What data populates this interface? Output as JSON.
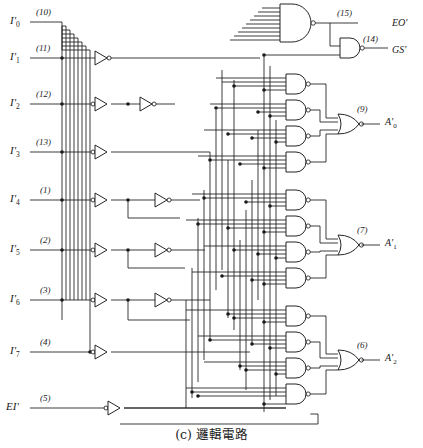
{
  "figure": {
    "caption": "(c) 邏輯電路",
    "ink_color": "#1a1a1a",
    "background": "#ffffff"
  },
  "inputs": [
    {
      "name": "I0",
      "label_html": "I'<sub>0</sub>",
      "pin": "(10)",
      "y": 22
    },
    {
      "name": "I1",
      "label_html": "I'<sub>1</sub>",
      "pin": "(11)",
      "y": 58
    },
    {
      "name": "I2",
      "label_html": "I'<sub>2</sub>",
      "pin": "(12)",
      "y": 104
    },
    {
      "name": "I3",
      "label_html": "I'<sub>3</sub>",
      "pin": "(13)",
      "y": 152
    },
    {
      "name": "I4",
      "label_html": "I'<sub>4</sub>",
      "pin": "(1)",
      "y": 200
    },
    {
      "name": "I5",
      "label_html": "I'<sub>5</sub>",
      "pin": "(2)",
      "y": 250
    },
    {
      "name": "I6",
      "label_html": "I'<sub>6</sub>",
      "pin": "(3)",
      "y": 300
    },
    {
      "name": "I7",
      "label_html": "I'<sub>7</sub>",
      "pin": "(4)",
      "y": 352
    },
    {
      "name": "EI",
      "label_html": "EI'",
      "pin": "(5)",
      "y": 408
    }
  ],
  "outputs": [
    {
      "name": "EO",
      "label_html": "EO'",
      "pin": "(15)",
      "y": 28
    },
    {
      "name": "GS",
      "label_html": "GS'",
      "pin": "(14)",
      "y": 54
    },
    {
      "name": "A0",
      "label_html": "A'<sub>0</sub>",
      "pin": "(9)",
      "y": 124
    },
    {
      "name": "A1",
      "label_html": "A'<sub>1</sub>",
      "pin": "(7)",
      "y": 245
    },
    {
      "name": "A2",
      "label_html": "A'<sub>2</sub>",
      "pin": "(6)",
      "y": 360
    }
  ],
  "gate_counts": {
    "input_inverting_buffers": 8,
    "inverters": 6,
    "nand_big_9input": 1,
    "nand_gates_matrix": 13,
    "nand_2input_gs": 1,
    "nor_output_gates": 3
  },
  "legend": {
    "note": "Priority encoder 74LS148 internal logic"
  }
}
